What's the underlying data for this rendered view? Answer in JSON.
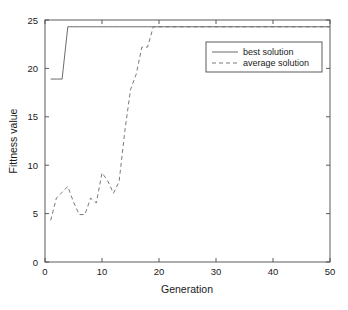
{
  "chart_data": {
    "type": "line",
    "title": "",
    "xlabel": "Generation",
    "ylabel": "Fittness value",
    "xlim": [
      0,
      50
    ],
    "ylim": [
      0,
      25
    ],
    "xticks": [
      0,
      10,
      20,
      30,
      40,
      50
    ],
    "yticks": [
      0,
      5,
      10,
      15,
      20,
      25
    ],
    "xtick_labels": [
      "0",
      "10",
      "20",
      "30",
      "40",
      "50"
    ],
    "ytick_labels": [
      "0",
      "5",
      "10",
      "15",
      "20",
      "25"
    ],
    "grid": false,
    "legend_position": "upper right",
    "series": [
      {
        "name": "best solution",
        "style": "solid",
        "color": "#5a5a5a",
        "x": [
          1,
          2,
          3,
          4,
          5,
          6,
          7,
          8,
          9,
          10,
          11,
          12,
          13,
          14,
          15,
          16,
          17,
          18,
          19,
          20,
          21,
          22,
          23,
          24,
          25,
          26,
          27,
          28,
          29,
          30,
          31,
          32,
          33,
          34,
          35,
          36,
          37,
          38,
          39,
          40,
          41,
          42,
          43,
          44,
          45,
          46,
          47,
          48,
          49,
          50
        ],
        "values": [
          18.9,
          18.9,
          18.9,
          24.3,
          24.3,
          24.3,
          24.3,
          24.3,
          24.3,
          24.3,
          24.3,
          24.3,
          24.3,
          24.3,
          24.3,
          24.3,
          24.3,
          24.3,
          24.3,
          24.3,
          24.3,
          24.3,
          24.3,
          24.3,
          24.3,
          24.3,
          24.3,
          24.3,
          24.3,
          24.3,
          24.3,
          24.3,
          24.3,
          24.3,
          24.3,
          24.3,
          24.3,
          24.3,
          24.3,
          24.3,
          24.3,
          24.3,
          24.3,
          24.3,
          24.3,
          24.3,
          24.3,
          24.3,
          24.3,
          24.3
        ]
      },
      {
        "name": "average solution",
        "style": "dashed",
        "color": "#6a6a6a",
        "x": [
          1,
          2,
          3,
          4,
          5,
          6,
          7,
          8,
          9,
          10,
          11,
          12,
          13,
          14,
          15,
          16,
          17,
          18,
          19,
          20,
          21,
          22,
          23,
          24,
          25,
          26,
          27,
          28,
          29,
          30,
          31,
          32,
          33,
          34,
          35,
          36,
          37,
          38,
          39,
          40,
          41,
          42,
          43,
          44,
          45,
          46,
          47,
          48,
          49,
          50
        ],
        "values": [
          4.3,
          6.6,
          7.2,
          7.8,
          6.2,
          4.9,
          4.9,
          6.6,
          6.1,
          9.2,
          8.4,
          7.1,
          8.3,
          13.5,
          17.8,
          19.4,
          22.2,
          22.2,
          24.3,
          24.3,
          24.3,
          24.3,
          24.3,
          24.3,
          24.3,
          24.3,
          24.3,
          24.3,
          24.3,
          24.3,
          24.3,
          24.3,
          24.3,
          24.3,
          24.3,
          24.3,
          24.3,
          24.3,
          24.3,
          24.3,
          24.3,
          24.3,
          24.3,
          24.3,
          24.3,
          24.3,
          24.3,
          24.3,
          24.3,
          24.3
        ]
      }
    ],
    "legend": [
      {
        "label": "best solution",
        "style": "solid"
      },
      {
        "label": "average solution",
        "style": "dashed"
      }
    ]
  }
}
